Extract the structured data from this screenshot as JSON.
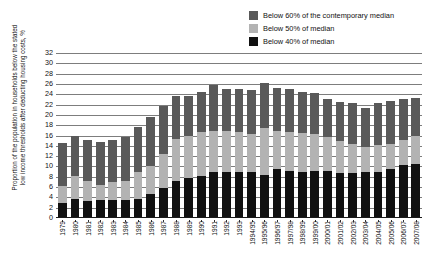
{
  "chart_data": {
    "type": "bar",
    "subtype": "stacked-bar",
    "title": "",
    "xlabel": "",
    "ylabel": "Proportion of the population in households below the stated low income thresholds after deducting housing costs, %",
    "ylim": [
      0,
      32
    ],
    "yticks": [
      0,
      2,
      4,
      6,
      8,
      10,
      12,
      14,
      16,
      18,
      20,
      22,
      24,
      26,
      28,
      30,
      32
    ],
    "grid": true,
    "legend_position": "top-right",
    "categories": [
      "1979",
      "1980",
      "1981",
      "1982",
      "1983",
      "1984",
      "1985",
      "1986",
      "1987",
      "1988",
      "1989",
      "1990",
      "1991",
      "1992",
      "1993",
      "1994/95",
      "1995/96",
      "1996/97",
      "1997/98",
      "1998/99",
      "1999/00",
      "2000/01",
      "2001/02",
      "2002/03",
      "2003/04",
      "2004/05",
      "2005/06",
      "2006/07",
      "2007/08"
    ],
    "series": [
      {
        "name": "Below 40% of median",
        "color": "#111111",
        "values": [
          2.9,
          3.6,
          3.3,
          3.4,
          3.5,
          3.5,
          3.6,
          4.6,
          5.8,
          7.2,
          7.8,
          8.2,
          8.9,
          9.0,
          9.0,
          8.9,
          8.3,
          9.6,
          9.1,
          8.9,
          9.2,
          9.2,
          8.7,
          8.8,
          9.0,
          8.9,
          9.6,
          10.3,
          10.5
        ]
      },
      {
        "name": "Below 50% of median",
        "color": "#b3b3b3",
        "values": [
          6.3,
          8.2,
          7.1,
          6.4,
          7.0,
          7.2,
          8.9,
          10.1,
          12.4,
          15.4,
          16.0,
          16.7,
          16.9,
          16.9,
          16.6,
          16.3,
          17.5,
          16.8,
          16.6,
          16.5,
          16.2,
          15.8,
          15.0,
          14.4,
          13.8,
          14.2,
          14.4,
          15.1,
          16.0
        ]
      },
      {
        "name": "Below 60% of the contemporary median",
        "color": "#595959",
        "values": [
          14.5,
          16.0,
          15.2,
          14.7,
          15.1,
          15.8,
          17.7,
          19.5,
          21.7,
          23.6,
          23.7,
          24.5,
          25.7,
          25.0,
          25.0,
          24.9,
          26.1,
          25.2,
          25.0,
          24.5,
          24.2,
          23.0,
          22.5,
          22.3,
          21.3,
          22.3,
          22.7,
          23.1,
          23.2
        ]
      }
    ],
    "legend": [
      {
        "label": "Below 60% of the contemporary median",
        "color": "#595959"
      },
      {
        "label": "Below 50% of median",
        "color": "#b3b3b3"
      },
      {
        "label": "Below 40% of median",
        "color": "#111111"
      }
    ]
  }
}
